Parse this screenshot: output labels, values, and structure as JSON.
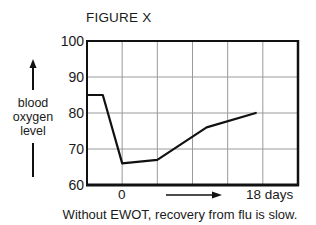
{
  "chart_data": {
    "type": "line",
    "title": "FIGURE X",
    "ylabel": "blood oxygen level",
    "ylabel_lines": [
      "blood",
      "oxygen",
      "level"
    ],
    "xlabel": "0 → 18 days",
    "x_tick_labels": {
      "start": "0",
      "end": "18 days"
    },
    "caption": "Without EWOT, recovery from flu is slow.",
    "ylim": [
      60,
      100
    ],
    "yticks": [
      100,
      90,
      80,
      70,
      60
    ],
    "x_grid_columns": 6,
    "grid": true,
    "series": [
      {
        "name": "blood oxygen level",
        "x_grid_units": [
          0,
          0.45,
          1.0,
          2.0,
          3.4,
          4.8
        ],
        "values": [
          85,
          85,
          66,
          67,
          76,
          80
        ]
      }
    ],
    "line_color": "#111111",
    "grid_color": "#9a9a9a",
    "frame_color": "#111111"
  }
}
